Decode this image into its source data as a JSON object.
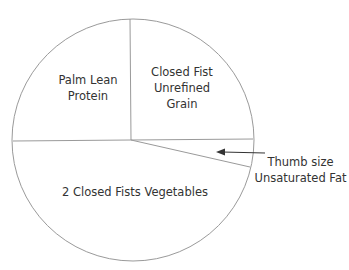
{
  "diagram": {
    "type": "portion-plate-pie",
    "colors": {
      "line": "#9a9a9a",
      "text": "#333333",
      "background": "#ffffff"
    },
    "segments": [
      {
        "id": "protein",
        "label": "Palm Lean\nProtein",
        "line1": "Palm Lean",
        "line2": "Protein"
      },
      {
        "id": "grain",
        "line1": "Closed Fist",
        "line2": "Unrefined",
        "line3": "Grain"
      },
      {
        "id": "vegetables",
        "line1": "2 Closed Fists Vegetables"
      },
      {
        "id": "fat",
        "line1": "Thumb size",
        "line2": "Unsaturated Fat"
      }
    ],
    "arrow": {
      "points_to": "fat",
      "direction": "left"
    }
  }
}
